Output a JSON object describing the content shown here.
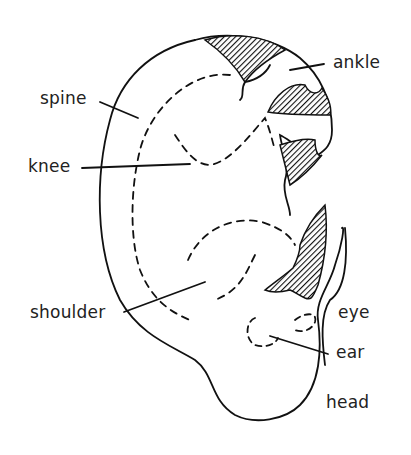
{
  "diagram": {
    "labels": [
      {
        "id": "ankle",
        "text": "ankle"
      },
      {
        "id": "spine",
        "text": "spine"
      },
      {
        "id": "knee",
        "text": "knee"
      },
      {
        "id": "shoulder",
        "text": "shoulder"
      },
      {
        "id": "eye",
        "text": "eye"
      },
      {
        "id": "ear",
        "text": "ear"
      },
      {
        "id": "head",
        "text": "head"
      }
    ],
    "colors": {
      "line": "#111111",
      "text": "#222222",
      "background": "#ffffff"
    }
  }
}
